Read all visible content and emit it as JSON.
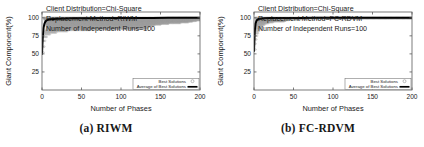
{
  "figure": {
    "panels": [
      {
        "id": "riwm",
        "subcaption": "(a)  RIWM",
        "annotations": {
          "line1": "Client Distribution=Chi-Square",
          "line2": "Replacement Method=RIWM",
          "line3": "Number of Independent Runs=100"
        },
        "legend": {
          "best_label": "Best Solutions",
          "avg_label": "Average of Best Solutions"
        }
      },
      {
        "id": "fcrdvm",
        "subcaption": "(b)  FC-RDVM",
        "annotations": {
          "line1": "Client Distribution=Chi-Square",
          "line2": "Replacement Method=FC-RDVM",
          "line3": "Number of Independent Runs=100"
        },
        "legend": {
          "best_label": "Best Solutions",
          "avg_label": "Average of Best Solutions"
        }
      }
    ]
  },
  "chart_data": [
    {
      "type": "scatter",
      "id": "riwm",
      "title": "",
      "subtitle": "",
      "xlabel": "Number of Phases",
      "ylabel": "Giant Component(%)",
      "xlim": [
        0,
        200
      ],
      "ylim": [
        0,
        108
      ],
      "xticks": [
        0,
        50,
        100,
        150,
        200
      ],
      "xtick_labels": [
        "0",
        "50",
        "100",
        "150",
        "200"
      ],
      "yticks": [
        25,
        50,
        75,
        100
      ],
      "ytick_labels": [
        "25",
        "50",
        "75",
        "100"
      ],
      "grid": false,
      "legend_position": "lower-right",
      "annotations": [
        "Client Distribution=Chi-Square",
        "Replacement Method=RIWM",
        "Number of Independent Runs=100"
      ],
      "series": [
        {
          "name": "Average of Best Solutions",
          "type": "line",
          "color": "#000000",
          "linewidth": 2.0,
          "x": [
            0,
            1,
            2,
            3,
            4,
            5,
            6,
            8,
            10,
            14,
            20,
            30,
            40,
            60,
            80,
            100,
            120,
            140,
            160,
            180,
            200
          ],
          "y": [
            50.0,
            74.0,
            86.0,
            91.5,
            94.0,
            95.6,
            96.5,
            97.4,
            97.9,
            98.4,
            98.8,
            99.1,
            99.3,
            99.5,
            99.6,
            99.7,
            99.8,
            99.85,
            99.9,
            99.95,
            100.0
          ]
        },
        {
          "name": "Best Solutions",
          "type": "scatter",
          "marker": "circle",
          "color": "#9a9a9a",
          "comment": "100 independent runs; dense horizontal bands of converged plateau values spanning phases 0-200",
          "bands": [
            {
              "y": 100.0,
              "x_start": 2,
              "x_end": 200
            },
            {
              "y": 99.2,
              "x_start": 3,
              "x_end": 200
            },
            {
              "y": 98.4,
              "x_start": 3,
              "x_end": 200
            },
            {
              "y": 97.5,
              "x_start": 3,
              "x_end": 200
            },
            {
              "y": 96.6,
              "x_start": 4,
              "x_end": 200
            },
            {
              "y": 95.7,
              "x_start": 4,
              "x_end": 195
            },
            {
              "y": 94.8,
              "x_start": 4,
              "x_end": 190
            },
            {
              "y": 93.8,
              "x_start": 4,
              "x_end": 185
            },
            {
              "y": 92.8,
              "x_start": 5,
              "x_end": 175
            },
            {
              "y": 91.8,
              "x_start": 5,
              "x_end": 160
            },
            {
              "y": 90.7,
              "x_start": 5,
              "x_end": 150
            },
            {
              "y": 89.6,
              "x_start": 5,
              "x_end": 142
            },
            {
              "y": 88.5,
              "x_start": 6,
              "x_end": 138
            },
            {
              "y": 87.3,
              "x_start": 6,
              "x_end": 135
            },
            {
              "y": 86.0,
              "x_start": 6,
              "x_end": 133
            },
            {
              "y": 84.7,
              "x_start": 6,
              "x_end": 133
            },
            {
              "y": 83.2,
              "x_start": 5,
              "x_end": 60
            },
            {
              "y": 81.5,
              "x_start": 4,
              "x_end": 32
            },
            {
              "y": 79.5,
              "x_start": 3,
              "x_end": 18
            },
            {
              "y": 77.0,
              "x_start": 2,
              "x_end": 10
            },
            {
              "y": 73.5,
              "x_start": 1,
              "x_end": 6
            },
            {
              "y": 68.0,
              "x_start": 1,
              "x_end": 4
            },
            {
              "y": 60.0,
              "x_start": 0,
              "x_end": 3
            },
            {
              "y": 52.0,
              "x_start": 0,
              "x_end": 2
            }
          ]
        }
      ]
    },
    {
      "type": "scatter",
      "id": "fcrdvm",
      "title": "",
      "subtitle": "",
      "xlabel": "Number of Phases",
      "ylabel": "Giant Component(%)",
      "xlim": [
        0,
        200
      ],
      "ylim": [
        0,
        108
      ],
      "xticks": [
        0,
        50,
        100,
        150,
        200
      ],
      "xtick_labels": [
        "0",
        "50",
        "100",
        "150",
        "200"
      ],
      "yticks": [
        25,
        50,
        75,
        100
      ],
      "ytick_labels": [
        "25",
        "50",
        "75",
        "100"
      ],
      "grid": false,
      "legend_position": "lower-right",
      "annotations": [
        "Client Distribution=Chi-Square",
        "Replacement Method=FC-RDVM",
        "Number of Independent Runs=100"
      ],
      "series": [
        {
          "name": "Average of Best Solutions",
          "type": "line",
          "color": "#000000",
          "linewidth": 2.0,
          "x": [
            0,
            1,
            2,
            3,
            4,
            5,
            6,
            8,
            10,
            14,
            20,
            30,
            40,
            60,
            80,
            100,
            120,
            140,
            160,
            180,
            200
          ],
          "y": [
            54.0,
            82.0,
            92.0,
            95.5,
            97.0,
            97.8,
            98.3,
            98.8,
            99.1,
            99.4,
            99.6,
            99.7,
            99.8,
            99.85,
            99.9,
            99.92,
            99.95,
            99.96,
            99.98,
            99.99,
            100.0
          ]
        },
        {
          "name": "Best Solutions",
          "type": "scatter",
          "marker": "circle",
          "color": "#9a9a9a",
          "comment": "100 independent runs; converge far faster, cloud collapses before phase 50",
          "bands": [
            {
              "y": 100.0,
              "x_start": 2,
              "x_end": 200
            },
            {
              "y": 99.0,
              "x_start": 2,
              "x_end": 200
            },
            {
              "y": 98.0,
              "x_start": 3,
              "x_end": 60
            },
            {
              "y": 97.0,
              "x_start": 3,
              "x_end": 44
            },
            {
              "y": 96.0,
              "x_start": 3,
              "x_end": 40
            },
            {
              "y": 95.0,
              "x_start": 3,
              "x_end": 38
            },
            {
              "y": 93.8,
              "x_start": 3,
              "x_end": 24
            },
            {
              "y": 92.5,
              "x_start": 2,
              "x_end": 18
            },
            {
              "y": 91.0,
              "x_start": 2,
              "x_end": 14
            },
            {
              "y": 89.5,
              "x_start": 2,
              "x_end": 12
            },
            {
              "y": 88.0,
              "x_start": 2,
              "x_end": 10
            },
            {
              "y": 86.0,
              "x_start": 2,
              "x_end": 9
            },
            {
              "y": 84.0,
              "x_start": 1,
              "x_end": 8
            },
            {
              "y": 81.5,
              "x_start": 1,
              "x_end": 6
            },
            {
              "y": 78.5,
              "x_start": 1,
              "x_end": 5
            },
            {
              "y": 75.0,
              "x_start": 1,
              "x_end": 4
            },
            {
              "y": 70.0,
              "x_start": 0,
              "x_end": 3
            },
            {
              "y": 64.0,
              "x_start": 0,
              "x_end": 2
            },
            {
              "y": 56.0,
              "x_start": 0,
              "x_end": 2
            }
          ]
        }
      ]
    }
  ]
}
